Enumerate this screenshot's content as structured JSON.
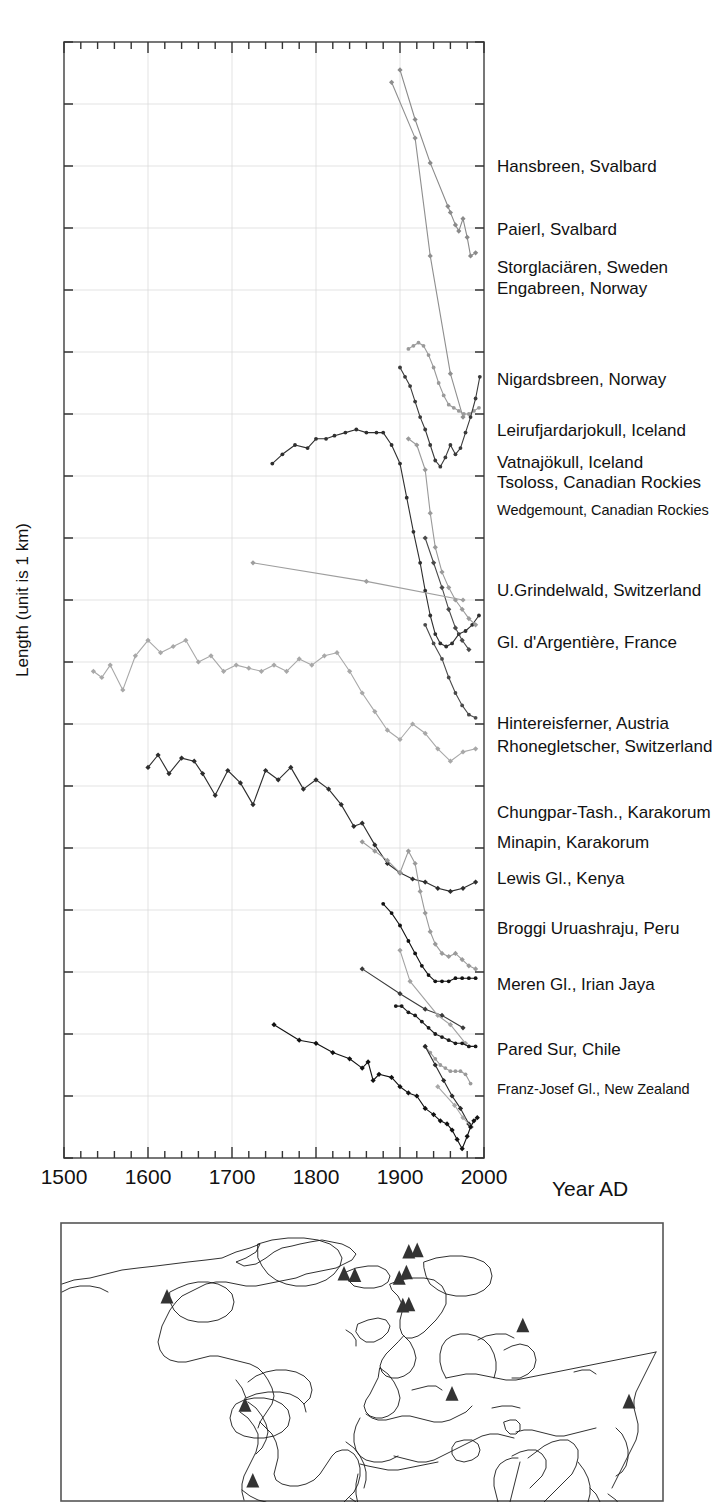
{
  "figure": {
    "y_axis_label": "Length (unit is 1 km)",
    "x_axis_label": "Year AD"
  },
  "chart_data": {
    "type": "line",
    "title": "",
    "xlabel": "Year AD",
    "ylabel": "Length (unit is 1 km)",
    "xlim": [
      1500,
      2000
    ],
    "xticks": [
      1500,
      1600,
      1700,
      1800,
      1900,
      2000
    ],
    "xtick_labels": [
      "1500",
      "1600",
      "1700",
      "1800",
      "1900",
      "2000"
    ],
    "minor_xtick_step": 20,
    "ylim": [
      0,
      18
    ],
    "yticks": [
      0,
      1,
      2,
      3,
      4,
      5,
      6,
      7,
      8,
      9,
      10,
      11,
      12,
      13,
      14,
      15,
      16,
      17,
      18
    ],
    "ytick_labels": [],
    "grid": true,
    "grid_color": "#d8d8d8",
    "legend_position": "right-inline",
    "note": "Each curve is vertically offset; the y axis shows only a 1 km scale unit, no absolute tick values.",
    "series": [
      {
        "name": "Hansbreen, Svalbard",
        "label_y": 170,
        "color": "#8a8a8a",
        "marker": "diamond",
        "x": [
          1900,
          1918,
          1936,
          1957,
          1960,
          1966,
          1970,
          1975,
          1980,
          1984,
          1990
        ],
        "y": [
          17.55,
          16.75,
          16.05,
          15.35,
          15.25,
          15.05,
          14.95,
          15.15,
          14.85,
          14.55,
          14.6
        ]
      },
      {
        "name": "Paierl, Svalbard",
        "label_y": 232,
        "color": "#8f8f8f",
        "marker": "diamond",
        "x": [
          1890,
          1918,
          1936,
          1960,
          1975
        ],
        "y": [
          17.35,
          16.45,
          14.55,
          12.65,
          11.95
        ]
      },
      {
        "name": "Storglaciären, Sweden",
        "label_y": 271,
        "color": "#9a9a9a",
        "marker": "dot",
        "x": [
          1910,
          1916,
          1922,
          1928,
          1934,
          1940,
          1946,
          1952,
          1958,
          1964,
          1970,
          1976,
          1982,
          1988,
          1994
        ],
        "y": [
          13.05,
          13.1,
          13.15,
          13.1,
          12.95,
          12.75,
          12.5,
          12.3,
          12.15,
          12.1,
          12.05,
          12.0,
          12.0,
          12.05,
          12.1
        ]
      },
      {
        "name": "Engabreen, Norway",
        "label_y": 292,
        "color": "#3a3a3a",
        "marker": "dot",
        "x": [
          1900,
          1906,
          1912,
          1918,
          1924,
          1930,
          1936,
          1942,
          1948,
          1954,
          1960,
          1966,
          1972,
          1978,
          1984,
          1990,
          1995
        ],
        "y": [
          12.75,
          12.6,
          12.45,
          12.2,
          11.95,
          11.75,
          11.5,
          11.25,
          11.15,
          11.3,
          11.5,
          11.35,
          11.45,
          11.7,
          11.95,
          12.25,
          12.6
        ]
      },
      {
        "name": "Nigardsbreen, Norway",
        "label_y": 383,
        "color": "#2f2f2f",
        "marker": "dot",
        "x": [
          1748,
          1760,
          1775,
          1790,
          1800,
          1812,
          1822,
          1835,
          1848,
          1860,
          1872,
          1880,
          1890,
          1900,
          1908,
          1916,
          1924,
          1930,
          1936,
          1942,
          1948,
          1955,
          1962,
          1970,
          1978,
          1986,
          1994
        ],
        "y": [
          11.2,
          11.35,
          11.5,
          11.45,
          11.6,
          11.6,
          11.65,
          11.7,
          11.75,
          11.7,
          11.7,
          11.7,
          11.5,
          11.2,
          10.65,
          10.1,
          9.6,
          9.15,
          8.75,
          8.45,
          8.3,
          8.25,
          8.3,
          8.45,
          8.5,
          8.6,
          8.75
        ]
      },
      {
        "name": "Leirufjardarjokull, Iceland",
        "label_y": 434,
        "color": "#9a9a9a",
        "marker": "diamond",
        "x": [
          1910,
          1920,
          1930,
          1936,
          1942,
          1950,
          1958,
          1966,
          1974,
          1982,
          1990
        ],
        "y": [
          11.6,
          11.5,
          11.1,
          10.4,
          9.85,
          9.45,
          9.2,
          9.0,
          8.85,
          8.7,
          8.6
        ]
      },
      {
        "name": "Vatnajökull, Iceland",
        "label_y": 466,
        "color": "#4a4a4a",
        "marker": "diamond",
        "x": [
          1930,
          1940,
          1950,
          1958,
          1966,
          1974,
          1982
        ],
        "y": [
          10.0,
          9.6,
          9.2,
          8.85,
          8.55,
          8.35,
          8.2
        ]
      },
      {
        "name": "Tsoloss, Canadian Rockies",
        "label_y": 485,
        "color": "#9e9e9e",
        "marker": "diamond",
        "x": [
          1725,
          1860,
          1975
        ],
        "y": [
          9.6,
          9.3,
          9.0
        ]
      },
      {
        "name": "Wedgemount, Canadian Rockies",
        "label_y": 512,
        "color": "#4a4a4a",
        "marker": "dot",
        "x": [
          1930,
          1940,
          1950,
          1958,
          1966,
          1974,
          1982,
          1990
        ],
        "y": [
          8.6,
          8.3,
          8.05,
          7.75,
          7.5,
          7.3,
          7.15,
          7.1
        ]
      },
      {
        "name": "U.Grindelwald, Switzerland",
        "label_y": 594,
        "color": "#a8a8a8",
        "marker": "diamond",
        "x": [
          1535,
          1545,
          1555,
          1570,
          1585,
          1600,
          1615,
          1630,
          1645,
          1660,
          1675,
          1690,
          1705,
          1720,
          1735,
          1750,
          1765,
          1780,
          1795,
          1810,
          1825,
          1840,
          1855,
          1870,
          1885,
          1900,
          1915,
          1930,
          1945,
          1960,
          1975,
          1990
        ],
        "y": [
          7.85,
          7.75,
          7.95,
          7.55,
          8.1,
          8.35,
          8.15,
          8.25,
          8.35,
          8.0,
          8.1,
          7.85,
          7.95,
          7.9,
          7.85,
          7.95,
          7.85,
          8.05,
          7.95,
          8.1,
          8.15,
          7.85,
          7.5,
          7.2,
          6.9,
          6.75,
          7.0,
          6.85,
          6.6,
          6.4,
          6.55,
          6.6
        ]
      },
      {
        "name": "Gl. d'Argentière, France",
        "label_y": 645,
        "color": "#2d2d2d",
        "marker": "diamond",
        "x": [
          1600,
          1612,
          1625,
          1640,
          1655,
          1665,
          1680,
          1695,
          1710,
          1725,
          1740,
          1755,
          1770,
          1785,
          1800,
          1815,
          1830,
          1845,
          1855,
          1870,
          1885,
          1900,
          1915,
          1930,
          1945,
          1960,
          1975,
          1990
        ],
        "y": [
          6.3,
          6.5,
          6.2,
          6.45,
          6.4,
          6.2,
          5.85,
          6.25,
          6.05,
          5.7,
          6.25,
          6.1,
          6.3,
          5.95,
          6.1,
          5.95,
          5.7,
          5.35,
          5.4,
          5.05,
          4.75,
          4.6,
          4.5,
          4.45,
          4.35,
          4.3,
          4.35,
          4.45
        ]
      },
      {
        "name": "Hintereisferner, Austria",
        "label_y": 727,
        "color": "#9a9a9a",
        "marker": "diamond",
        "x": [
          1855,
          1870,
          1885,
          1900,
          1910,
          1918,
          1924,
          1930,
          1936,
          1942,
          1950,
          1958,
          1966,
          1974,
          1982,
          1990
        ],
        "y": [
          5.1,
          4.95,
          4.8,
          4.6,
          4.95,
          4.75,
          4.3,
          3.95,
          3.65,
          3.45,
          3.3,
          3.25,
          3.3,
          3.2,
          3.1,
          3.05
        ]
      },
      {
        "name": "Rhonegletscher, Switzerland",
        "label_y": 750,
        "color": "#111111",
        "marker": "dot",
        "x": [
          1880,
          1890,
          1900,
          1910,
          1918,
          1926,
          1934,
          1942,
          1950,
          1958,
          1966,
          1974,
          1982,
          1990
        ],
        "y": [
          4.1,
          3.95,
          3.75,
          3.5,
          3.3,
          3.1,
          2.95,
          2.85,
          2.85,
          2.85,
          2.9,
          2.9,
          2.9,
          2.9
        ]
      },
      {
        "name": "Chungpar-Tash., Karakorum",
        "label_y": 816,
        "color": "#3a3a3a",
        "marker": "diamond",
        "x": [
          1855,
          1900,
          1930,
          1950,
          1975
        ],
        "y": [
          3.05,
          2.65,
          2.4,
          2.3,
          2.1
        ]
      },
      {
        "name": "Minapin, Karakorum",
        "label_y": 845,
        "color": "#a2a2a2",
        "marker": "diamond",
        "x": [
          1900,
          1912,
          1945,
          1960,
          1978
        ],
        "y": [
          3.35,
          2.85,
          2.3,
          2.15,
          1.85
        ]
      },
      {
        "name": "Lewis Gl., Kenya",
        "label_y": 881,
        "color": "#1a1a1a",
        "marker": "dot",
        "x": [
          1895,
          1902,
          1910,
          1918,
          1926,
          1934,
          1942,
          1950,
          1958,
          1966,
          1974,
          1982,
          1990
        ],
        "y": [
          2.45,
          2.45,
          2.35,
          2.3,
          2.2,
          2.1,
          2.0,
          1.95,
          1.9,
          1.85,
          1.85,
          1.8,
          1.8
        ]
      },
      {
        "name": "Broggi Uruashraju, Peru",
        "label_y": 932,
        "color": "#9a9a9a",
        "marker": "dot",
        "x": [
          1930,
          1936,
          1942,
          1948,
          1954,
          1960,
          1966,
          1972,
          1978,
          1984
        ],
        "y": [
          1.8,
          1.7,
          1.6,
          1.5,
          1.45,
          1.4,
          1.4,
          1.4,
          1.35,
          1.2
        ]
      },
      {
        "name": "Meren Gl., Irian Jaya",
        "label_y": 988,
        "color": "#2a2a2a",
        "marker": "diamond",
        "x": [
          1930,
          1942,
          1952,
          1962,
          1972,
          1982
        ],
        "y": [
          1.8,
          1.5,
          1.25,
          1.0,
          0.8,
          0.55
        ]
      },
      {
        "name": "Pared Sur, Chile",
        "label_y": 1053,
        "color": "#a8a8a8",
        "marker": "diamond",
        "x": [
          1945,
          1965,
          1975,
          1985
        ],
        "y": [
          1.15,
          0.85,
          0.65,
          0.5
        ]
      },
      {
        "name": "Franz-Josef Gl., New Zealand",
        "label_y": 1091,
        "color": "#111111",
        "marker": "diamond",
        "x": [
          1750,
          1780,
          1800,
          1820,
          1840,
          1855,
          1862,
          1868,
          1875,
          1890,
          1900,
          1910,
          1920,
          1930,
          1940,
          1948,
          1956,
          1962,
          1968,
          1974,
          1980,
          1984,
          1988,
          1992
        ],
        "y": [
          2.15,
          1.9,
          1.85,
          1.7,
          1.6,
          1.45,
          1.55,
          1.25,
          1.35,
          1.3,
          1.15,
          1.05,
          1.0,
          0.8,
          0.7,
          0.6,
          0.55,
          0.45,
          0.3,
          0.15,
          0.35,
          0.5,
          0.6,
          0.65
        ]
      }
    ]
  },
  "labels": [
    {
      "text": "Hansbreen, Svalbard",
      "y": 172,
      "size": "normal"
    },
    {
      "text": "Paierl, Svalbard",
      "y": 235,
      "size": "normal"
    },
    {
      "text": "Storglaciären, Sweden",
      "y": 273,
      "size": "normal"
    },
    {
      "text": "Engabreen,  Norway",
      "y": 294,
      "size": "normal"
    },
    {
      "text": "Nigardsbreen, Norway",
      "y": 385,
      "size": "normal"
    },
    {
      "text": "Leirufjardarjokull, Iceland",
      "y": 436,
      "size": "normal"
    },
    {
      "text": "Vatnajökull,  Iceland",
      "y": 468,
      "size": "normal"
    },
    {
      "text": "Tsoloss, Canadian Rockies",
      "y": 488,
      "size": "normal"
    },
    {
      "text": "Wedgemount, Canadian Rockies",
      "y": 515,
      "size": "small"
    },
    {
      "text": "U.Grindelwald, Switzerland",
      "y": 596,
      "size": "normal"
    },
    {
      "text": "Gl. d'Argentière, France",
      "y": 648,
      "size": "normal"
    },
    {
      "text": "Hintereisferner, Austria",
      "y": 729,
      "size": "normal"
    },
    {
      "text": "Rhonegletscher, Switzerland",
      "y": 752,
      "size": "normal"
    },
    {
      "text": "Chungpar-Tash., Karakorum",
      "y": 818,
      "size": "normal"
    },
    {
      "text": "Minapin,  Karakorum",
      "y": 848,
      "size": "normal"
    },
    {
      "text": "Lewis Gl., Kenya",
      "y": 884,
      "size": "normal"
    },
    {
      "text": "Broggi Uruashraju, Peru",
      "y": 934,
      "size": "normal"
    },
    {
      "text": "Meren Gl.,  Irian Jaya",
      "y": 990,
      "size": "normal"
    },
    {
      "text": "Pared Sur, Chile",
      "y": 1055,
      "size": "normal"
    },
    {
      "text": "Franz-Josef Gl., New Zealand",
      "y": 1094,
      "size": "small"
    }
  ],
  "map": {
    "name": "world-map",
    "projection": "equirectangular",
    "marker_shape": "triangle",
    "marker_color": "#333333",
    "markers": [
      {
        "region": "Svalbard",
        "x": 0.578,
        "y": 0.105
      },
      {
        "region": "Svalbard-2",
        "x": 0.592,
        "y": 0.1
      },
      {
        "region": "Greenland-east",
        "x": 0.47,
        "y": 0.185
      },
      {
        "region": "Iceland",
        "x": 0.488,
        "y": 0.19
      },
      {
        "region": "Scandinavia-north",
        "x": 0.574,
        "y": 0.18
      },
      {
        "region": "Norway",
        "x": 0.562,
        "y": 0.2
      },
      {
        "region": "Alps",
        "x": 0.568,
        "y": 0.3
      },
      {
        "region": "Alps-2",
        "x": 0.578,
        "y": 0.296
      },
      {
        "region": "Canadian Rockies",
        "x": 0.175,
        "y": 0.268
      },
      {
        "region": "Karakorum",
        "x": 0.768,
        "y": 0.372
      },
      {
        "region": "Kenya",
        "x": 0.65,
        "y": 0.62
      },
      {
        "region": "Irian Jaya",
        "x": 0.945,
        "y": 0.648
      },
      {
        "region": "Peru",
        "x": 0.305,
        "y": 0.66
      },
      {
        "region": "Chile-south",
        "x": 0.318,
        "y": 0.935
      }
    ]
  },
  "style": {
    "frame_color": "#555555",
    "grid_color": "#dcdcdc",
    "background": "#ffffff"
  }
}
